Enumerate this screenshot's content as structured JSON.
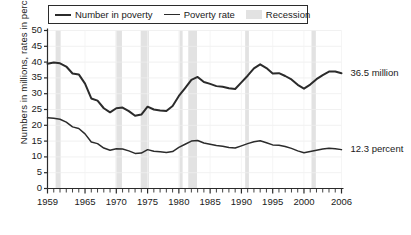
{
  "chart_data": {
    "type": "line",
    "title": "",
    "xlabel": "",
    "ylabel": "Numbers in millions, rates in percent",
    "xlim": [
      1959,
      2006
    ],
    "ylim": [
      0,
      50
    ],
    "grid": true,
    "legend_position": "top",
    "y_ticks": [
      0,
      5,
      10,
      15,
      20,
      25,
      30,
      35,
      40,
      45,
      50
    ],
    "x_ticks": [
      1959,
      1965,
      1970,
      1975,
      1980,
      1985,
      1990,
      1995,
      2000,
      2006
    ],
    "x_tick_labels": [
      "1959",
      "1965",
      "1970",
      "1975",
      "1980",
      "1985",
      "1990",
      "1995",
      "2000",
      "2006"
    ],
    "y_tick_labels": [
      "0",
      "5",
      "10",
      "15",
      "20",
      "25",
      "30",
      "35",
      "40",
      "45",
      "50"
    ],
    "series": [
      {
        "name": "Number in poverty",
        "unit": "millions",
        "color": "#2b2b2b",
        "end_label": "36.5 million",
        "x": [
          1959,
          1960,
          1961,
          1962,
          1963,
          1964,
          1965,
          1966,
          1967,
          1968,
          1969,
          1970,
          1971,
          1972,
          1973,
          1974,
          1975,
          1976,
          1977,
          1978,
          1979,
          1980,
          1981,
          1982,
          1983,
          1984,
          1985,
          1986,
          1987,
          1988,
          1989,
          1990,
          1991,
          1992,
          1993,
          1994,
          1995,
          1996,
          1997,
          1998,
          1999,
          2000,
          2001,
          2002,
          2003,
          2004,
          2005,
          2006
        ],
        "values": [
          39.5,
          39.9,
          39.6,
          38.6,
          36.4,
          36.1,
          33.2,
          28.5,
          27.8,
          25.4,
          24.1,
          25.4,
          25.6,
          24.5,
          23.0,
          23.4,
          25.9,
          25.0,
          24.7,
          24.5,
          26.1,
          29.3,
          31.8,
          34.4,
          35.3,
          33.7,
          33.1,
          32.4,
          32.2,
          31.7,
          31.5,
          33.6,
          35.7,
          38.0,
          39.3,
          38.1,
          36.4,
          36.5,
          35.6,
          34.5,
          32.8,
          31.6,
          32.9,
          34.6,
          35.9,
          37.0,
          37.0,
          36.5
        ]
      },
      {
        "name": "Poverty rate",
        "unit": "percent",
        "color": "#2b2b2b",
        "end_label": "12.3 percent",
        "x": [
          1959,
          1960,
          1961,
          1962,
          1963,
          1964,
          1965,
          1966,
          1967,
          1968,
          1969,
          1970,
          1971,
          1972,
          1973,
          1974,
          1975,
          1976,
          1977,
          1978,
          1979,
          1980,
          1981,
          1982,
          1983,
          1984,
          1985,
          1986,
          1987,
          1988,
          1989,
          1990,
          1991,
          1992,
          1993,
          1994,
          1995,
          1996,
          1997,
          1998,
          1999,
          2000,
          2001,
          2002,
          2003,
          2004,
          2005,
          2006
        ],
        "values": [
          22.4,
          22.2,
          21.9,
          21.0,
          19.5,
          19.0,
          17.3,
          14.7,
          14.2,
          12.8,
          12.1,
          12.6,
          12.5,
          11.9,
          11.1,
          11.2,
          12.3,
          11.8,
          11.6,
          11.4,
          11.7,
          13.0,
          14.0,
          15.0,
          15.2,
          14.4,
          14.0,
          13.6,
          13.4,
          13.0,
          12.8,
          13.5,
          14.2,
          14.8,
          15.1,
          14.5,
          13.8,
          13.7,
          13.3,
          12.7,
          11.9,
          11.3,
          11.7,
          12.1,
          12.5,
          12.7,
          12.6,
          12.3
        ]
      }
    ],
    "recessions": [
      {
        "start": 1960.3,
        "end": 1961.1
      },
      {
        "start": 1969.9,
        "end": 1970.9
      },
      {
        "start": 1973.9,
        "end": 1975.2
      },
      {
        "start": 1980.1,
        "end": 1980.6
      },
      {
        "start": 1981.5,
        "end": 1982.9
      },
      {
        "start": 1990.6,
        "end": 1991.2
      },
      {
        "start": 2001.2,
        "end": 2001.9
      }
    ],
    "recession_color": "#e2e2e2"
  },
  "legend": {
    "items": [
      {
        "label": "Number in poverty",
        "type": "line"
      },
      {
        "label": "Poverty rate",
        "type": "line"
      },
      {
        "label": "Recession",
        "type": "band"
      }
    ]
  },
  "annotations": {
    "number_in_poverty_end": "36.5 million",
    "poverty_rate_end": "12.3 percent"
  }
}
